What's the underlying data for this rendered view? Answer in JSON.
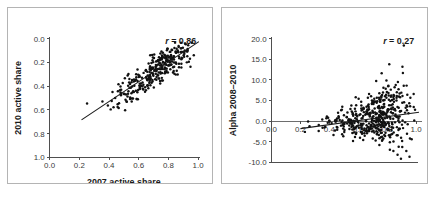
{
  "figure": {
    "background": "#ffffff",
    "panel_border_color": "#b4b4b4",
    "point_color": "#111111",
    "line_color": "#1a1a1a",
    "axis_color": "#4d4d4d"
  },
  "chart_data": [
    {
      "type": "scatter",
      "panel": "left",
      "title": "",
      "xlabel": "2007 active share",
      "ylabel": "2010 active share",
      "xlim": [
        0.0,
        1.0
      ],
      "ylim": [
        0.0,
        1.0
      ],
      "xticks": [
        0.0,
        0.2,
        0.4,
        0.6,
        0.8,
        1.0
      ],
      "yticks": [
        0.0,
        0.2,
        0.4,
        0.6,
        0.8,
        1.0
      ],
      "xticklabels": [
        "0.0",
        "0.2",
        "0.4",
        "0.6",
        "0.8",
        "1.0"
      ],
      "yticklabels": [
        "0.0",
        "0.2",
        "0.4",
        "0.6",
        "0.8",
        "1.0"
      ],
      "grid": false,
      "legend": false,
      "annotation": "r = 0.86",
      "annotation_symbol": "r",
      "annotation_value": "= 0.86",
      "correlation": 0.86,
      "n_points": 320,
      "fit_line": {
        "x0": 0.215,
        "y0": 0.315,
        "x1": 1.005,
        "y1": 0.975
      },
      "generator": {
        "seed": 20101,
        "x_mean": 0.735,
        "x_sd": 0.145,
        "x_min": 0.21,
        "x_max": 1.0,
        "x_skew_pull": 0.34,
        "slope": 0.835,
        "intercept": 0.135,
        "resid_sd": 0.068,
        "y_min": 0.165,
        "y_max": 0.995
      }
    },
    {
      "type": "scatter",
      "panel": "right",
      "title": "",
      "xlabel": "2007 active share",
      "ylabel": "Alpha 2008–2010",
      "xlim": [
        0.0,
        1.0
      ],
      "ylim": [
        -10.0,
        20.0
      ],
      "xticks": [
        0.0,
        0.2,
        0.4,
        0.6,
        0.8,
        1.0
      ],
      "yticks": [
        -10.0,
        -5.0,
        0.0,
        5.0,
        10.0,
        15.0,
        20.0
      ],
      "xticklabels": [
        "0.0",
        "0.2",
        "0.4",
        "0.6",
        "0.8",
        "1.0"
      ],
      "yticklabels": [
        "20.0",
        "15.0",
        "10.0",
        "5.0",
        "0.0",
        "-5.0",
        "-10.0"
      ],
      "xtick_labels_at_zero": true,
      "grid": false,
      "legend": false,
      "annotation": "r = 0.27",
      "annotation_symbol": "r",
      "annotation_value": "= 0.27",
      "correlation": 0.27,
      "n_points": 470,
      "fit_line": {
        "x0": 0.2,
        "y0": -1.85,
        "x1": 1.02,
        "y1": 2.15
      },
      "generator": {
        "seed": 77013,
        "x_mean": 0.735,
        "x_sd": 0.145,
        "x_min": 0.2,
        "x_max": 1.0,
        "x_skew_pull": 0.34,
        "slope": 4.9,
        "intercept": -2.83,
        "resid_sd_base": 1.1,
        "resid_sd_growth": 5.4,
        "y_min": -9.8,
        "y_max": 18.7
      }
    }
  ]
}
